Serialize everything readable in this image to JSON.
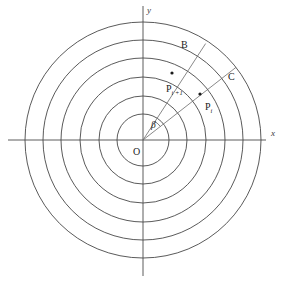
{
  "figure": {
    "background_color": "#ffffff",
    "line_color": "#3c3c3c",
    "ray_color": "#6b6b6b",
    "axis_color": "#4a4a4a",
    "text_color": "#1a1a1a",
    "width": 283,
    "height": 282
  },
  "origin": {
    "label": "O",
    "x": 143,
    "y": 140,
    "label_x": 133,
    "label_y": 155
  },
  "axes": {
    "x_axis": {
      "label": "x",
      "label_x": 271,
      "label_y": 136,
      "x1": 8,
      "y1": 140,
      "x2": 266,
      "y2": 140
    },
    "y_axis": {
      "label": "y",
      "label_x": 147,
      "label_y": 13,
      "x1": 143,
      "y1": 6,
      "x2": 143,
      "y2": 276
    }
  },
  "circles": [
    {
      "name": "circle-1",
      "radius": 26
    },
    {
      "name": "circle-2",
      "radius": 44
    },
    {
      "name": "circle-3",
      "radius": 63
    },
    {
      "name": "circle-4",
      "radius": 82
    },
    {
      "name": "circle-5",
      "radius": 100
    },
    {
      "name": "circle-6",
      "radius": 118
    }
  ],
  "rays": [
    {
      "name": "ray-ob",
      "end_label": "B",
      "angle_deg": 57,
      "length": 115,
      "label_x": 181,
      "label_y": 48
    },
    {
      "name": "ray-oc",
      "end_label": "C",
      "angle_deg": 38,
      "length": 118,
      "label_x": 228,
      "label_y": 80
    }
  ],
  "points": [
    {
      "name": "point-pi-plus-1",
      "base": "P",
      "subscript": "i +1",
      "x": 172,
      "y": 73,
      "label_x": 166,
      "label_y": 92
    },
    {
      "name": "point-pi",
      "base": "P",
      "subscript": "i",
      "x": 200,
      "y": 94,
      "label_x": 205,
      "label_y": 110
    }
  ],
  "angle": {
    "name": "angle-beta",
    "label": "β",
    "label_x": 151,
    "label_y": 128,
    "arc_radius": 22,
    "from_deg": 38,
    "to_deg": 57
  },
  "chart_data": {
    "type": "scatter",
    "xlabel": "x",
    "ylabel": "y",
    "grid": true,
    "legend": "none",
    "circle_radii_px": [
      26,
      44,
      63,
      82,
      100,
      118
    ],
    "ray_angles_deg": [
      57,
      38
    ],
    "ray_labels": [
      "B",
      "C"
    ],
    "annotations": [
      "O",
      "β",
      "B",
      "C",
      "Pi+1",
      "Pi"
    ],
    "points": [
      {
        "label": "Pi+1",
        "ray": "OB",
        "radius_px": 44,
        "angle_deg": 57
      },
      {
        "label": "Pi",
        "ray": "OC",
        "radius_px": 72,
        "angle_deg": 38
      }
    ]
  }
}
